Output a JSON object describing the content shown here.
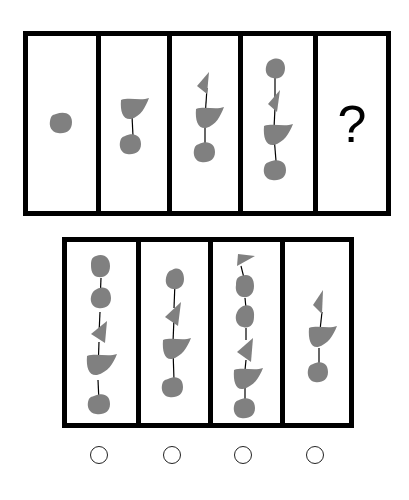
{
  "puzzle": {
    "question_mark": "?",
    "shape_color": "#808080",
    "line_color": "#000000",
    "sequence": [
      {
        "panel": 1,
        "shapes_top_to_bottom": [
          "blob"
        ]
      },
      {
        "panel": 2,
        "shapes_top_to_bottom": [
          "leaf",
          "blob"
        ]
      },
      {
        "panel": 3,
        "shapes_top_to_bottom": [
          "triangle",
          "leaf",
          "blob"
        ]
      },
      {
        "panel": 4,
        "shapes_top_to_bottom": [
          "blob",
          "triangle",
          "leaf",
          "blob"
        ]
      },
      {
        "panel": 5,
        "shapes_top_to_bottom": [],
        "unknown": true
      }
    ],
    "options": [
      {
        "index": 1,
        "shapes_top_to_bottom": [
          "blob",
          "blob",
          "triangle",
          "leaf",
          "blob"
        ]
      },
      {
        "index": 2,
        "shapes_top_to_bottom": [
          "blob",
          "triangle",
          "leaf",
          "blob"
        ]
      },
      {
        "index": 3,
        "shapes_top_to_bottom": [
          "triangle",
          "blob",
          "blob",
          "triangle",
          "leaf",
          "blob"
        ]
      },
      {
        "index": 4,
        "shapes_top_to_bottom": [
          "triangle",
          "leaf",
          "blob"
        ]
      }
    ]
  }
}
